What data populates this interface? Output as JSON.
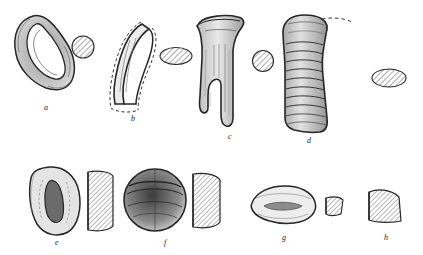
{
  "figure": {
    "type": "archaeological-artifact-illustration-plate",
    "background_color": "#ffffff",
    "ink_color": "#262626",
    "hatch_color": "#4a4a4a",
    "width": 423,
    "height": 255,
    "rows": [
      {
        "row_id": "top-row",
        "items": [
          "a",
          "b",
          "c",
          "d"
        ]
      },
      {
        "row_id": "bottom-row",
        "items": [
          "e",
          "f",
          "g",
          "h"
        ]
      }
    ],
    "items": [
      {
        "id": "a",
        "label": "a",
        "label_x": 44,
        "label_y": 108,
        "description": "loop-handle sherd drawing with oval perforation, shaded outline",
        "profile": "hatched circular section at right"
      },
      {
        "id": "b",
        "label": "b",
        "label_x": 131,
        "label_y": 119,
        "description": "curved strap handle fragment with dashed reconstruction outline",
        "profile": "hatched oval section at right"
      },
      {
        "id": "c",
        "label": "c",
        "label_x": 228,
        "label_y": 137,
        "description": "vertical handle with flaring rim and stippled body",
        "profile": "hatched circular section at right"
      },
      {
        "id": "d",
        "label": "d",
        "label_x": 307,
        "label_y": 141,
        "description": "ribbed / corrugated vertical handle with dense stippling",
        "profile": "hatched oval section at right"
      },
      {
        "id": "e",
        "label": "e",
        "label_x": 55,
        "label_y": 243,
        "description": "rounded lug with central depression, shaded",
        "profile": "hatched vertical section at right"
      },
      {
        "id": "f",
        "label": "f",
        "label_x": 164,
        "label_y": 243,
        "description": "circular boss / knob with dark shaded hollow",
        "profile": "hatched vertical section at right"
      },
      {
        "id": "g",
        "label": "g",
        "label_x": 282,
        "label_y": 238,
        "description": "low flattened oval lug with stippled centre",
        "profile": "small hatched section at right"
      },
      {
        "id": "h",
        "label": "h",
        "label_x": 384,
        "label_y": 238,
        "description": "small triangular profile-only drawing, hatched",
        "profile": "hatched triangular section"
      }
    ]
  }
}
